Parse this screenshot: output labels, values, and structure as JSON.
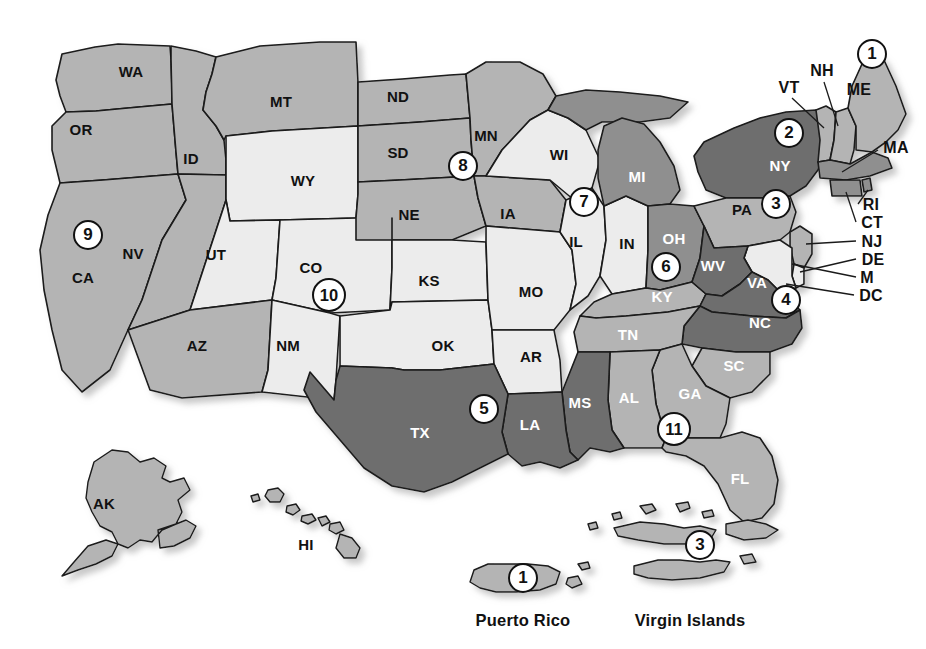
{
  "map": {
    "title": "United States Federal Judicial Circuits Map",
    "palette": {
      "dark": "#6e6e6e",
      "medium_dark": "#8f8f8f",
      "medium": "#b4b4b4",
      "light": "#dcdcdc",
      "lighter": "#ececec",
      "outline": "#1a1a1a",
      "background": "#ffffff",
      "label_dark": "#111111",
      "label_light": "#ffffff"
    },
    "state_labels": [
      {
        "id": "WA",
        "text": "WA",
        "x": 131,
        "y": 71,
        "tone": "dark"
      },
      {
        "id": "OR",
        "text": "OR",
        "x": 81,
        "y": 129,
        "tone": "dark"
      },
      {
        "id": "ID",
        "text": "ID",
        "x": 191,
        "y": 158,
        "tone": "dark"
      },
      {
        "id": "MT",
        "text": "MT",
        "x": 281,
        "y": 101,
        "tone": "dark"
      },
      {
        "id": "ND",
        "text": "ND",
        "x": 398,
        "y": 96,
        "tone": "dark"
      },
      {
        "id": "SD",
        "text": "SD",
        "x": 398,
        "y": 152,
        "tone": "dark"
      },
      {
        "id": "MN",
        "text": "MN",
        "x": 486,
        "y": 135,
        "tone": "dark"
      },
      {
        "id": "WI",
        "text": "WI",
        "x": 559,
        "y": 154,
        "tone": "dark"
      },
      {
        "id": "MI",
        "text": "MI",
        "x": 637,
        "y": 176,
        "tone": "light"
      },
      {
        "id": "WY",
        "text": "WY",
        "x": 303,
        "y": 180,
        "tone": "dark"
      },
      {
        "id": "NE",
        "text": "NE",
        "x": 409,
        "y": 214,
        "tone": "dark"
      },
      {
        "id": "IA",
        "text": "IA",
        "x": 508,
        "y": 213,
        "tone": "dark"
      },
      {
        "id": "NV",
        "text": "NV",
        "x": 133,
        "y": 253,
        "tone": "dark"
      },
      {
        "id": "UT",
        "text": "UT",
        "x": 216,
        "y": 254,
        "tone": "dark"
      },
      {
        "id": "CO",
        "text": "CO",
        "x": 311,
        "y": 267,
        "tone": "dark"
      },
      {
        "id": "CA",
        "text": "CA",
        "x": 83,
        "y": 277,
        "tone": "dark"
      },
      {
        "id": "IL",
        "text": "IL",
        "x": 576,
        "y": 241,
        "tone": "dark"
      },
      {
        "id": "IN",
        "text": "IN",
        "x": 627,
        "y": 243,
        "tone": "dark"
      },
      {
        "id": "OH",
        "text": "OH",
        "x": 674,
        "y": 238,
        "tone": "light"
      },
      {
        "id": "PA",
        "text": "PA",
        "x": 742,
        "y": 209,
        "tone": "dark"
      },
      {
        "id": "NY",
        "text": "NY",
        "x": 780,
        "y": 165,
        "tone": "light"
      },
      {
        "id": "WV",
        "text": "WV",
        "x": 713,
        "y": 265,
        "tone": "light"
      },
      {
        "id": "VA",
        "text": "VA",
        "x": 757,
        "y": 282,
        "tone": "light"
      },
      {
        "id": "KS",
        "text": "KS",
        "x": 429,
        "y": 280,
        "tone": "dark"
      },
      {
        "id": "MO",
        "text": "MO",
        "x": 531,
        "y": 291,
        "tone": "dark"
      },
      {
        "id": "KY",
        "text": "KY",
        "x": 662,
        "y": 296,
        "tone": "light"
      },
      {
        "id": "AZ",
        "text": "AZ",
        "x": 197,
        "y": 345,
        "tone": "dark"
      },
      {
        "id": "NM",
        "text": "NM",
        "x": 288,
        "y": 345,
        "tone": "dark"
      },
      {
        "id": "OK",
        "text": "OK",
        "x": 443,
        "y": 345,
        "tone": "dark"
      },
      {
        "id": "AR",
        "text": "AR",
        "x": 531,
        "y": 356,
        "tone": "dark"
      },
      {
        "id": "TN",
        "text": "TN",
        "x": 628,
        "y": 334,
        "tone": "light"
      },
      {
        "id": "NC",
        "text": "NC",
        "x": 760,
        "y": 322,
        "tone": "light"
      },
      {
        "id": "SC",
        "text": "SC",
        "x": 734,
        "y": 365,
        "tone": "light"
      },
      {
        "id": "MS",
        "text": "MS",
        "x": 580,
        "y": 402,
        "tone": "light"
      },
      {
        "id": "AL",
        "text": "AL",
        "x": 629,
        "y": 397,
        "tone": "light"
      },
      {
        "id": "GA",
        "text": "GA",
        "x": 690,
        "y": 393,
        "tone": "light"
      },
      {
        "id": "LA",
        "text": "LA",
        "x": 530,
        "y": 424,
        "tone": "light"
      },
      {
        "id": "TX",
        "text": "TX",
        "x": 420,
        "y": 432,
        "tone": "light"
      },
      {
        "id": "FL",
        "text": "FL",
        "x": 740,
        "y": 478,
        "tone": "light"
      },
      {
        "id": "AK",
        "text": "AK",
        "x": 104,
        "y": 503,
        "tone": "dark"
      },
      {
        "id": "HI",
        "text": "HI",
        "x": 306,
        "y": 544,
        "tone": "dark"
      }
    ],
    "callout_labels": [
      {
        "id": "VT",
        "text": "VT",
        "x": 789,
        "y": 88,
        "tone": "dark"
      },
      {
        "id": "NH",
        "text": "NH",
        "x": 822,
        "y": 71,
        "tone": "dark"
      },
      {
        "id": "ME",
        "text": "ME",
        "x": 859,
        "y": 90,
        "tone": "dark"
      },
      {
        "id": "MA",
        "text": "MA",
        "x": 896,
        "y": 148,
        "tone": "dark"
      },
      {
        "id": "RI",
        "text": "RI",
        "x": 871,
        "y": 205,
        "tone": "dark"
      },
      {
        "id": "CT",
        "text": "CT",
        "x": 872,
        "y": 223,
        "tone": "dark"
      },
      {
        "id": "NJ",
        "text": "NJ",
        "x": 872,
        "y": 242,
        "tone": "dark"
      },
      {
        "id": "DE",
        "text": "DE",
        "x": 873,
        "y": 260,
        "tone": "dark"
      },
      {
        "id": "M",
        "text": "M",
        "x": 867,
        "y": 278,
        "tone": "dark"
      },
      {
        "id": "DC",
        "text": "DC",
        "x": 871,
        "y": 296,
        "tone": "dark"
      }
    ],
    "badges": [
      {
        "id": "circuit-1-me",
        "value": "1",
        "x": 872,
        "y": 54,
        "size": "w1"
      },
      {
        "id": "circuit-2-ny",
        "value": "2",
        "x": 789,
        "y": 133,
        "size": "w1"
      },
      {
        "id": "circuit-3-pa",
        "value": "3",
        "x": 776,
        "y": 204,
        "size": "w1"
      },
      {
        "id": "circuit-4-nc",
        "value": "4",
        "x": 786,
        "y": 300,
        "size": "w1"
      },
      {
        "id": "circuit-5-tx",
        "value": "5",
        "x": 484,
        "y": 409,
        "size": "w1"
      },
      {
        "id": "circuit-6-oh",
        "value": "6",
        "x": 666,
        "y": 267,
        "size": "w1"
      },
      {
        "id": "circuit-7-il",
        "value": "7",
        "x": 584,
        "y": 202,
        "size": "w1"
      },
      {
        "id": "circuit-8-mn",
        "value": "8",
        "x": 463,
        "y": 166,
        "size": "w1"
      },
      {
        "id": "circuit-9-ca",
        "value": "9",
        "x": 88,
        "y": 235,
        "size": "w1"
      },
      {
        "id": "circuit-10-co",
        "value": "10",
        "x": 329,
        "y": 295,
        "size": "w2"
      },
      {
        "id": "circuit-11-ga",
        "value": "11",
        "x": 674,
        "y": 429,
        "size": "w2"
      },
      {
        "id": "circuit-1-pr",
        "value": "1",
        "x": 523,
        "y": 578,
        "size": "w1"
      },
      {
        "id": "circuit-3-vi",
        "value": "3",
        "x": 700,
        "y": 545,
        "size": "w1"
      }
    ],
    "territories": [
      {
        "id": "puerto-rico",
        "name": "Puerto Rico",
        "label_x": 523,
        "label_y": 620
      },
      {
        "id": "virgin-islands",
        "name": "Virgin Islands",
        "label_x": 690,
        "label_y": 620
      }
    ]
  }
}
